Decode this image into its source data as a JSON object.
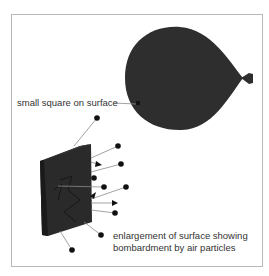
{
  "diagram": {
    "labels": {
      "small_square": "small square on surface",
      "enlargement_line1": "enlargement of surface showing",
      "enlargement_line2": "bombardment by air particles"
    },
    "colors": {
      "balloon": "#2e2e2e",
      "surface": "#2a2a2a",
      "particle": "#111111",
      "line": "#8a8a8a",
      "frame": "#b8b8b8",
      "text": "#333333"
    },
    "elements": [
      "balloon",
      "small-square-marker",
      "enlarged-surface-panel",
      "air-particles",
      "trajectory-lines"
    ]
  }
}
